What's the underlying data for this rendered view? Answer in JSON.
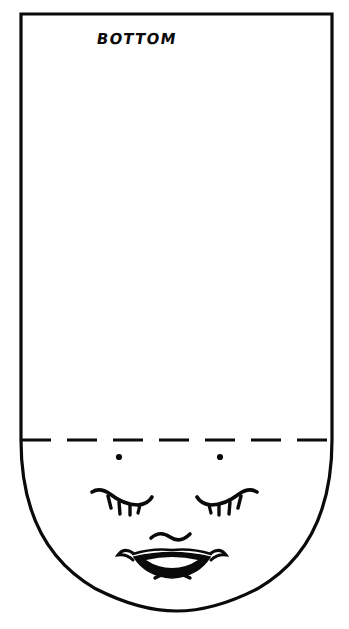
{
  "document": {
    "kind": "line-art-sewing-pattern-piece",
    "background_color": "#ffffff",
    "ink_color": "#0a0a0a",
    "width": 349,
    "height": 629
  },
  "labels": {
    "piece_label": "BOTTOM"
  },
  "outline": {
    "name": "pattern-outline",
    "description": "rectangle with rounded bottom",
    "left_x": 21,
    "right_x": 332,
    "top_y": 14,
    "fold_y": 440,
    "bottom_y": 611,
    "stroke_width": 3.2
  },
  "fold_line": {
    "name": "fold-dashed-line",
    "y": 440,
    "x_start": 21,
    "x_end": 332,
    "dash": "30 16",
    "stroke_width": 3
  },
  "face": {
    "name": "doll-face",
    "eye_dots": [
      {
        "cx": 119,
        "cy": 457,
        "r": 3.1
      },
      {
        "cx": 220,
        "cy": 457,
        "r": 3.1
      }
    ],
    "left_eye": {
      "lid_path": "M 92 492 Q 100 487 110 494 Q 124 505 138 505 Q 148 504 152 497",
      "lashes": [
        "M 108 496 L 111 508",
        "M 119 502 L 120 513",
        "M 130 505 L 130 515",
        "M 140 505 L 138 513"
      ]
    },
    "right_eye": {
      "lid_path": "M 257 492 Q 249 487 239 494 Q 225 505 211 505 Q 201 504 197 497",
      "lashes": [
        "M 241 496 L 238 508",
        "M 230 502 L 229 513",
        "M 219 505 L 219 515",
        "M 209 505 L 211 513"
      ]
    },
    "nose_path": "M 151 538 Q 160 530 170 537 Q 180 544 190 534",
    "mouth": {
      "upper_lip_path": "M 131 552 Q 136 547 141 551 Q 146 556 152 557",
      "left_corner_path": "M 131 552 Q 124 549 120 556 Q 127 555 132 560",
      "right_corner_path": "M 212 552 Q 219 549 223 556 Q 216 555 211 560",
      "opening_path": "M 134 557 Q 172 548 210 557 Q 198 576 172 578 Q 146 576 134 557",
      "inner_tooth_path": "M 146 560 Q 172 554 198 560 Q 186 568 172 568 Q 158 568 146 560"
    },
    "chin_path": "M 155 578 Q 172 568 190 578"
  }
}
